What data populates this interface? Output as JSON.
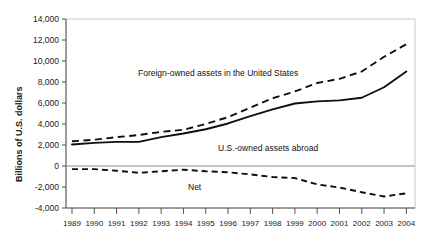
{
  "chart_data": {
    "type": "line",
    "title": "",
    "xlabel": "",
    "ylabel": "Billions of U.S. dollars",
    "grid": false,
    "legend_position": "inline-annotations",
    "x": [
      1989,
      1990,
      1991,
      1992,
      1993,
      1994,
      1995,
      1996,
      1997,
      1998,
      1999,
      2000,
      2001,
      2002,
      2003,
      2004
    ],
    "xtick_labels": [
      "1989",
      "1990",
      "1991",
      "1992",
      "1993",
      "1994",
      "1995",
      "1996",
      "1997",
      "1998",
      "1999",
      "2000",
      "2001",
      "2002",
      "2003",
      "2004"
    ],
    "ytick_labels": [
      "14,000",
      "12,000",
      "10,000",
      "8,000",
      "6,000",
      "4,000",
      "2,000",
      "0",
      "-2,000",
      "-4,000"
    ],
    "ytick_values": [
      14000,
      12000,
      10000,
      8000,
      6000,
      4000,
      2000,
      0,
      -2000,
      -4000
    ],
    "ylim": [
      -4000,
      14000
    ],
    "xlim": [
      1989,
      2004
    ],
    "series": [
      {
        "name": "Foreign-owned assets in the United States",
        "style": "dashed",
        "label_text": "Foreign-owned assets in the United States",
        "values": [
          2350,
          2500,
          2750,
          2950,
          3250,
          3450,
          4000,
          4650,
          5550,
          6450,
          7100,
          7900,
          8300,
          9000,
          10400,
          11600
        ]
      },
      {
        "name": "U.S.-owned assets abroad",
        "style": "solid",
        "label_text": "U.S.-owned assets abroad",
        "values": [
          2050,
          2200,
          2300,
          2300,
          2750,
          3100,
          3500,
          4050,
          4750,
          5400,
          5950,
          6150,
          6250,
          6500,
          7500,
          9000
        ]
      },
      {
        "name": "Net",
        "style": "dashed",
        "label_text": "Net",
        "values": [
          -300,
          -300,
          -450,
          -650,
          -500,
          -350,
          -500,
          -600,
          -800,
          -1050,
          -1150,
          -1750,
          -2050,
          -2500,
          -2900,
          -2600
        ]
      }
    ]
  },
  "annotations": {
    "foreign_label": "Foreign-owned assets in the United States",
    "usowned_label": "U.S.-owned assets abroad",
    "net_label": "Net"
  }
}
